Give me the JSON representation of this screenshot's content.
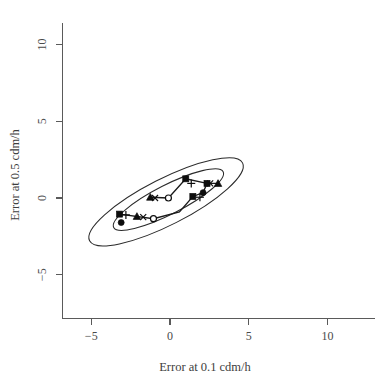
{
  "figure": {
    "background_color": "#ffffff",
    "ink_color": "#2b2b2b",
    "axis_color": "#5a5a5a"
  },
  "chart_data": {
    "type": "scatter",
    "title": "",
    "subtitle": "",
    "xlabel": "Error at 0.1 cdm/h",
    "ylabel": "Error at 0.5 cdm/h",
    "xlim": [
      -7.0,
      12.5
    ],
    "ylim": [
      -7.0,
      12.0
    ],
    "xticks": [
      -5,
      0,
      5,
      10
    ],
    "xticklabels": [
      "-5",
      "0",
      "5",
      "10"
    ],
    "yticks": [
      -5,
      0,
      5,
      10
    ],
    "yticklabels": [
      "-5",
      "0",
      "5",
      "10"
    ],
    "grid": false,
    "legend": "none",
    "annotations": [
      "Two concentric confidence ellipses centred near the origin, major axis tilted about 27 degrees, indicating strong positive correlation between the two error measures."
    ],
    "series": [
      {
        "name": "filled-square",
        "marker": "filled-square",
        "points": [
          {
            "x": -3.2,
            "y": -1.05
          },
          {
            "x": 1.0,
            "y": 1.25
          },
          {
            "x": 1.45,
            "y": 0.1
          },
          {
            "x": 2.35,
            "y": 0.95
          }
        ]
      },
      {
        "name": "plus",
        "marker": "plus",
        "points": [
          {
            "x": -2.8,
            "y": -1.1
          },
          {
            "x": 1.35,
            "y": 0.95
          },
          {
            "x": 1.9,
            "y": 0.05
          }
        ]
      },
      {
        "name": "filled-circle",
        "marker": "filled-circle",
        "points": [
          {
            "x": -3.1,
            "y": -1.6
          },
          {
            "x": 2.1,
            "y": 0.35
          }
        ]
      },
      {
        "name": "filled-triangle",
        "marker": "filled-triangle",
        "points": [
          {
            "x": -2.1,
            "y": -1.2
          },
          {
            "x": -1.25,
            "y": 0.05
          },
          {
            "x": 3.05,
            "y": 0.95
          }
        ]
      },
      {
        "name": "cross-x",
        "marker": "cross-x",
        "points": [
          {
            "x": -1.7,
            "y": -1.25
          },
          {
            "x": -0.95,
            "y": 0.0
          },
          {
            "x": 2.55,
            "y": 0.95
          }
        ]
      },
      {
        "name": "open-circle",
        "marker": "open-circle",
        "points": [
          {
            "x": -1.05,
            "y": -1.35
          },
          {
            "x": -0.1,
            "y": 0.0
          }
        ]
      }
    ],
    "ellipses": [
      {
        "name": "outer-ellipse",
        "center": {
          "x": -0.25,
          "y": -0.25
        },
        "semi_major": 5.45,
        "semi_minor": 1.5,
        "angle_deg": 27.0
      },
      {
        "name": "inner-ellipse",
        "center": {
          "x": -0.1,
          "y": -0.1
        },
        "semi_major": 3.9,
        "semi_minor": 0.95,
        "angle_deg": 27.0
      }
    ]
  }
}
